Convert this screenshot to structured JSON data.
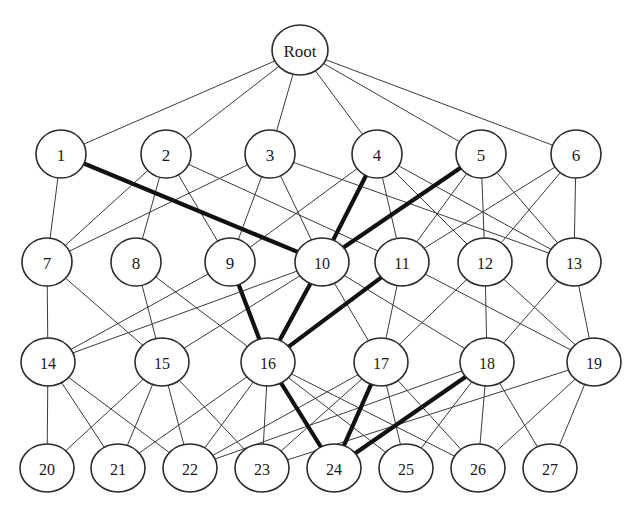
{
  "diagram": {
    "background_color": "#ffffff",
    "node_fill": "#ffffff",
    "node_stroke": "#2b2b2b",
    "edge_color": "#3a3a3a",
    "highlight_color": "#111111",
    "layer_count": 5,
    "node_count": 28
  },
  "nodes": [
    {
      "id": "root",
      "label": "Root",
      "cx": 300,
      "cy": 50,
      "rx": 28,
      "ry": 25,
      "layer": 0
    },
    {
      "id": "n1",
      "label": "1",
      "cx": 61,
      "cy": 154,
      "rx": 25,
      "ry": 24,
      "layer": 1
    },
    {
      "id": "n2",
      "label": "2",
      "cx": 166,
      "cy": 154,
      "rx": 25,
      "ry": 24,
      "layer": 1
    },
    {
      "id": "n3",
      "label": "3",
      "cx": 270,
      "cy": 154,
      "rx": 25,
      "ry": 24,
      "layer": 1
    },
    {
      "id": "n4",
      "label": "4",
      "cx": 377,
      "cy": 154,
      "rx": 25,
      "ry": 24,
      "layer": 1
    },
    {
      "id": "n5",
      "label": "5",
      "cx": 481,
      "cy": 154,
      "rx": 25,
      "ry": 24,
      "layer": 1
    },
    {
      "id": "n6",
      "label": "6",
      "cx": 576,
      "cy": 154,
      "rx": 25,
      "ry": 24,
      "layer": 1
    },
    {
      "id": "n7",
      "label": "7",
      "cx": 47,
      "cy": 262,
      "rx": 25,
      "ry": 24,
      "layer": 2
    },
    {
      "id": "n8",
      "label": "8",
      "cx": 136,
      "cy": 262,
      "rx": 25,
      "ry": 24,
      "layer": 2
    },
    {
      "id": "n9",
      "label": "9",
      "cx": 230,
      "cy": 262,
      "rx": 25,
      "ry": 24,
      "layer": 2
    },
    {
      "id": "n10",
      "label": "10",
      "cx": 322,
      "cy": 262,
      "rx": 27,
      "ry": 24,
      "layer": 2
    },
    {
      "id": "n11",
      "label": "11",
      "cx": 402,
      "cy": 262,
      "rx": 27,
      "ry": 24,
      "layer": 2
    },
    {
      "id": "n12",
      "label": "12",
      "cx": 485,
      "cy": 262,
      "rx": 27,
      "ry": 24,
      "layer": 2
    },
    {
      "id": "n13",
      "label": "13",
      "cx": 574,
      "cy": 262,
      "rx": 27,
      "ry": 24,
      "layer": 2
    },
    {
      "id": "n14",
      "label": "14",
      "cx": 48,
      "cy": 362,
      "rx": 27,
      "ry": 24,
      "layer": 3
    },
    {
      "id": "n15",
      "label": "15",
      "cx": 162,
      "cy": 362,
      "rx": 27,
      "ry": 24,
      "layer": 3
    },
    {
      "id": "n16",
      "label": "16",
      "cx": 268,
      "cy": 362,
      "rx": 27,
      "ry": 24,
      "layer": 3
    },
    {
      "id": "n17",
      "label": "17",
      "cx": 381,
      "cy": 362,
      "rx": 27,
      "ry": 24,
      "layer": 3
    },
    {
      "id": "n18",
      "label": "18",
      "cx": 487,
      "cy": 362,
      "rx": 27,
      "ry": 24,
      "layer": 3
    },
    {
      "id": "n19",
      "label": "19",
      "cx": 594,
      "cy": 362,
      "rx": 27,
      "ry": 24,
      "layer": 3
    },
    {
      "id": "n20",
      "label": "20",
      "cx": 47,
      "cy": 468,
      "rx": 27,
      "ry": 24,
      "layer": 4
    },
    {
      "id": "n21",
      "label": "21",
      "cx": 118,
      "cy": 468,
      "rx": 27,
      "ry": 24,
      "layer": 4
    },
    {
      "id": "n22",
      "label": "22",
      "cx": 190,
      "cy": 468,
      "rx": 27,
      "ry": 24,
      "layer": 4
    },
    {
      "id": "n23",
      "label": "23",
      "cx": 262,
      "cy": 468,
      "rx": 27,
      "ry": 24,
      "layer": 4
    },
    {
      "id": "n24",
      "label": "24",
      "cx": 334,
      "cy": 468,
      "rx": 27,
      "ry": 24,
      "layer": 4
    },
    {
      "id": "n25",
      "label": "25",
      "cx": 406,
      "cy": 468,
      "rx": 27,
      "ry": 24,
      "layer": 4
    },
    {
      "id": "n26",
      "label": "26",
      "cx": 478,
      "cy": 468,
      "rx": 27,
      "ry": 24,
      "layer": 4
    },
    {
      "id": "n27",
      "label": "27",
      "cx": 550,
      "cy": 468,
      "rx": 27,
      "ry": 24,
      "layer": 4
    }
  ],
  "edges": [
    {
      "from": "root",
      "to": "n1",
      "highlighted": false
    },
    {
      "from": "root",
      "to": "n2",
      "highlighted": false
    },
    {
      "from": "root",
      "to": "n3",
      "highlighted": false
    },
    {
      "from": "root",
      "to": "n4",
      "highlighted": false
    },
    {
      "from": "root",
      "to": "n5",
      "highlighted": false
    },
    {
      "from": "root",
      "to": "n6",
      "highlighted": false
    },
    {
      "from": "n1",
      "to": "n7",
      "highlighted": false
    },
    {
      "from": "n1",
      "to": "n10",
      "highlighted": true
    },
    {
      "from": "n2",
      "to": "n7",
      "highlighted": false
    },
    {
      "from": "n2",
      "to": "n8",
      "highlighted": false
    },
    {
      "from": "n2",
      "to": "n9",
      "highlighted": false
    },
    {
      "from": "n2",
      "to": "n11",
      "highlighted": false
    },
    {
      "from": "n3",
      "to": "n7",
      "highlighted": false
    },
    {
      "from": "n3",
      "to": "n9",
      "highlighted": false
    },
    {
      "from": "n3",
      "to": "n10",
      "highlighted": false
    },
    {
      "from": "n3",
      "to": "n13",
      "highlighted": false
    },
    {
      "from": "n4",
      "to": "n9",
      "highlighted": false
    },
    {
      "from": "n4",
      "to": "n10",
      "highlighted": true
    },
    {
      "from": "n4",
      "to": "n11",
      "highlighted": false
    },
    {
      "from": "n4",
      "to": "n12",
      "highlighted": false
    },
    {
      "from": "n4",
      "to": "n13",
      "highlighted": false
    },
    {
      "from": "n5",
      "to": "n10",
      "highlighted": true
    },
    {
      "from": "n5",
      "to": "n11",
      "highlighted": false
    },
    {
      "from": "n5",
      "to": "n12",
      "highlighted": false
    },
    {
      "from": "n5",
      "to": "n13",
      "highlighted": false
    },
    {
      "from": "n6",
      "to": "n11",
      "highlighted": false
    },
    {
      "from": "n6",
      "to": "n12",
      "highlighted": false
    },
    {
      "from": "n6",
      "to": "n13",
      "highlighted": false
    },
    {
      "from": "n7",
      "to": "n14",
      "highlighted": false
    },
    {
      "from": "n7",
      "to": "n15",
      "highlighted": false
    },
    {
      "from": "n8",
      "to": "n15",
      "highlighted": false
    },
    {
      "from": "n8",
      "to": "n16",
      "highlighted": false
    },
    {
      "from": "n9",
      "to": "n14",
      "highlighted": false
    },
    {
      "from": "n9",
      "to": "n16",
      "highlighted": true
    },
    {
      "from": "n10",
      "to": "n14",
      "highlighted": false
    },
    {
      "from": "n10",
      "to": "n15",
      "highlighted": false
    },
    {
      "from": "n10",
      "to": "n16",
      "highlighted": true
    },
    {
      "from": "n10",
      "to": "n17",
      "highlighted": false
    },
    {
      "from": "n10",
      "to": "n18",
      "highlighted": false
    },
    {
      "from": "n11",
      "to": "n16",
      "highlighted": true
    },
    {
      "from": "n11",
      "to": "n17",
      "highlighted": false
    },
    {
      "from": "n11",
      "to": "n19",
      "highlighted": false
    },
    {
      "from": "n12",
      "to": "n17",
      "highlighted": false
    },
    {
      "from": "n12",
      "to": "n18",
      "highlighted": false
    },
    {
      "from": "n12",
      "to": "n19",
      "highlighted": false
    },
    {
      "from": "n13",
      "to": "n18",
      "highlighted": false
    },
    {
      "from": "n13",
      "to": "n19",
      "highlighted": false
    },
    {
      "from": "n14",
      "to": "n20",
      "highlighted": false
    },
    {
      "from": "n14",
      "to": "n21",
      "highlighted": false
    },
    {
      "from": "n14",
      "to": "n22",
      "highlighted": false
    },
    {
      "from": "n15",
      "to": "n20",
      "highlighted": false
    },
    {
      "from": "n15",
      "to": "n21",
      "highlighted": false
    },
    {
      "from": "n15",
      "to": "n22",
      "highlighted": false
    },
    {
      "from": "n15",
      "to": "n23",
      "highlighted": false
    },
    {
      "from": "n16",
      "to": "n21",
      "highlighted": false
    },
    {
      "from": "n16",
      "to": "n22",
      "highlighted": false
    },
    {
      "from": "n16",
      "to": "n23",
      "highlighted": false
    },
    {
      "from": "n16",
      "to": "n24",
      "highlighted": true
    },
    {
      "from": "n16",
      "to": "n25",
      "highlighted": false
    },
    {
      "from": "n16",
      "to": "n26",
      "highlighted": false
    },
    {
      "from": "n17",
      "to": "n22",
      "highlighted": false
    },
    {
      "from": "n17",
      "to": "n23",
      "highlighted": false
    },
    {
      "from": "n17",
      "to": "n24",
      "highlighted": true
    },
    {
      "from": "n17",
      "to": "n25",
      "highlighted": false
    },
    {
      "from": "n17",
      "to": "n26",
      "highlighted": false
    },
    {
      "from": "n18",
      "to": "n22",
      "highlighted": false
    },
    {
      "from": "n18",
      "to": "n24",
      "highlighted": true
    },
    {
      "from": "n18",
      "to": "n25",
      "highlighted": false
    },
    {
      "from": "n18",
      "to": "n26",
      "highlighted": false
    },
    {
      "from": "n18",
      "to": "n27",
      "highlighted": false
    },
    {
      "from": "n19",
      "to": "n23",
      "highlighted": false
    },
    {
      "from": "n19",
      "to": "n26",
      "highlighted": false
    },
    {
      "from": "n19",
      "to": "n27",
      "highlighted": false
    }
  ],
  "highlighted_path": [
    "root",
    "n1",
    "n10",
    "n16",
    "n24"
  ]
}
